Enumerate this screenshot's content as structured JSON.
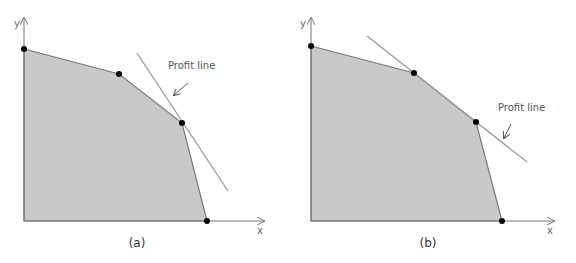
{
  "colors": {
    "region_fill": "#c9c9c9",
    "region_edge": "#7a7a7a",
    "axis": "#777777",
    "profit_line": "#9a9a9a",
    "vertex": "#000000",
    "label": "#555555"
  },
  "panels": [
    {
      "id": "a",
      "caption": "(a)",
      "x_label": "x",
      "y_label": "y",
      "profit_label": "Profit line",
      "origin": [
        24,
        221
      ],
      "y_axis_top": [
        24,
        18
      ],
      "x_axis_end": [
        264,
        221
      ],
      "vertices": [
        [
          24,
          49
        ],
        [
          119,
          74
        ],
        [
          182,
          123
        ],
        [
          207,
          221
        ]
      ],
      "profit_line": [
        [
          137,
          53
        ],
        [
          228,
          191
        ]
      ],
      "label_pos": [
        168,
        69
      ],
      "arrow": [
        [
          188,
          83
        ],
        [
          174,
          95
        ]
      ],
      "caption_pos": [
        137,
        247
      ],
      "x_label_pos": [
        257,
        234
      ],
      "y_label_pos": [
        14,
        27
      ]
    },
    {
      "id": "b",
      "caption": "(b)",
      "x_label": "x",
      "y_label": "y",
      "profit_label": "Profit line",
      "origin": [
        311,
        221
      ],
      "y_axis_top": [
        311,
        18
      ],
      "x_axis_end": [
        554,
        221
      ],
      "vertices": [
        [
          311,
          46
        ],
        [
          414,
          73
        ],
        [
          476,
          122
        ],
        [
          502,
          221
        ]
      ],
      "profit_line": [
        [
          367,
          36
        ],
        [
          527,
          162
        ]
      ],
      "label_pos": [
        498,
        111
      ],
      "arrow": [
        [
          511,
          124
        ],
        [
          504,
          138
        ]
      ],
      "caption_pos": [
        428,
        247
      ],
      "x_label_pos": [
        547,
        234
      ],
      "y_label_pos": [
        300,
        27
      ]
    }
  ]
}
